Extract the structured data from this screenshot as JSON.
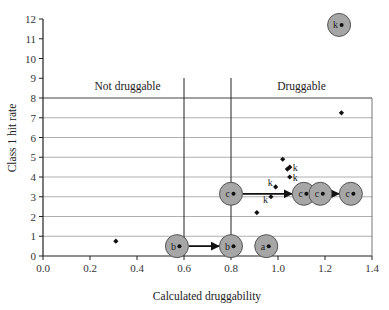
{
  "chart_data": {
    "type": "scatter",
    "title": "",
    "xlabel": "Calculated druggability",
    "ylabel": "Class 1 hit rate",
    "xlim": [
      0.0,
      1.4
    ],
    "ylim": [
      0,
      12
    ],
    "x_ticks": [
      "0.0",
      "0.2",
      "0.4",
      "0.6",
      "0.8",
      "1.0",
      "1.2",
      "1.4"
    ],
    "y_ticks": [
      "0",
      "1",
      "2",
      "3",
      "4",
      "5",
      "6",
      "7",
      "8",
      "9",
      "10",
      "11",
      "12"
    ],
    "grid": {
      "horizontal": [
        1,
        2,
        3,
        4,
        5,
        6,
        7,
        8
      ],
      "box_top": 8
    },
    "thresholds": [
      {
        "x": 0.6,
        "label": ""
      },
      {
        "x": 0.8,
        "label": ""
      }
    ],
    "region_labels": [
      {
        "text": "Not druggable",
        "x": 0.36,
        "y": 8.5
      },
      {
        "text": "Druggable",
        "x": 1.1,
        "y": 8.5
      }
    ],
    "points": [
      {
        "x": 0.31,
        "y": 0.75,
        "label": ""
      },
      {
        "x": 0.91,
        "y": 2.2,
        "label": ""
      },
      {
        "x": 0.97,
        "y": 3.0,
        "label": "k"
      },
      {
        "x": 0.99,
        "y": 3.5,
        "label": "k"
      },
      {
        "x": 1.02,
        "y": 4.9,
        "label": ""
      },
      {
        "x": 1.04,
        "y": 4.4,
        "label": ""
      },
      {
        "x": 1.05,
        "y": 4.5,
        "label": "k"
      },
      {
        "x": 1.05,
        "y": 4.0,
        "label": "k"
      },
      {
        "x": 1.27,
        "y": 7.25,
        "label": ""
      }
    ],
    "highlighted": [
      {
        "x": 0.57,
        "y": 0.5,
        "label": "b"
      },
      {
        "x": 0.8,
        "y": 0.5,
        "label": "b"
      },
      {
        "x": 0.95,
        "y": 0.5,
        "label": "a"
      },
      {
        "x": 0.8,
        "y": 3.15,
        "label": "c"
      },
      {
        "x": 1.11,
        "y": 3.15,
        "label": "c"
      },
      {
        "x": 1.18,
        "y": 3.15,
        "label": "c"
      },
      {
        "x": 1.31,
        "y": 3.15,
        "label": "c"
      },
      {
        "x": 1.26,
        "y": 11.7,
        "label": "k"
      }
    ],
    "arrows": [
      {
        "from": [
          0.57,
          0.5
        ],
        "to": [
          0.8,
          0.5
        ]
      },
      {
        "from": [
          0.8,
          3.15
        ],
        "to": [
          1.11,
          3.15
        ]
      },
      {
        "from": [
          1.18,
          3.15
        ],
        "to": [
          1.31,
          3.15
        ]
      }
    ]
  },
  "style": {
    "bubble_fill": "#a6a6a6",
    "bubble_stroke": "#555555",
    "point_color": "#111111",
    "grid_color": "#9a9a9a",
    "axis_color": "#222222"
  }
}
